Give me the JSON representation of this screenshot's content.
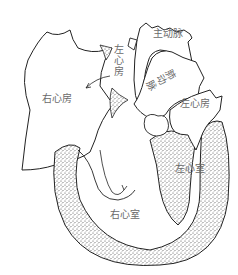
{
  "diagram": {
    "type": "anatomical-illustration",
    "labels": {
      "aorta": "主动脉",
      "left_atrium_top": "左心房",
      "pulmonary_artery": "肺动脉",
      "right_atrium": "右心房",
      "left_atrium": "左心房",
      "left_ventricle": "左心室",
      "right_ventricle": "右心室"
    },
    "colors": {
      "outline": "#222222",
      "label": "#6a6a6a",
      "stipple": "#555555",
      "background": "#ffffff"
    }
  }
}
